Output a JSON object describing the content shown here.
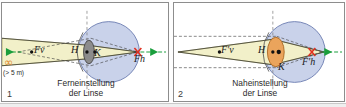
{
  "figure": {
    "title_semantic": "eye-accommodation-diagram",
    "panel_count": 2
  },
  "colors": {
    "sclera_fill": "#c9d2ea",
    "sclera_stroke": "#6b7bb0",
    "ray_cone_fill": "#f2f0c9",
    "ray_cone_stroke": "#8a8530",
    "lens_far_fill": "#8c8c8c",
    "lens_far_stroke": "#3a3a3a",
    "lens_near_fill": "#eaa45c",
    "lens_near_stroke": "#a8651f",
    "axis_green": "#1a9e3c",
    "focus_red": "#e03020",
    "infinity_orange": "#e08a2e",
    "dashed_gray": "#707070",
    "panel_border": "#8d8d8d",
    "label_black": "#1a1a1a"
  },
  "panels": [
    {
      "number": "1",
      "caption_line1": "Ferneinstellung",
      "caption_line2": "der Linse",
      "distance_note": "(> 5 m)",
      "infinity_symbol": "∞",
      "labels": [
        {
          "name": "front-focal-point",
          "text": "Fv"
        },
        {
          "name": "principal-plane",
          "text": "H"
        },
        {
          "name": "nodal-point",
          "text": "K"
        },
        {
          "name": "rear-focal-point",
          "text": "Fh"
        }
      ],
      "lens_state": "flattened",
      "object_distance": "infinity"
    },
    {
      "number": "2",
      "caption_line1": "Naheinstellung",
      "caption_line2": "der Linse",
      "distance_note": "",
      "infinity_symbol": "",
      "labels": [
        {
          "name": "front-focal-point",
          "text": "F'v"
        },
        {
          "name": "principal-plane",
          "text": "H"
        },
        {
          "name": "nodal-point",
          "text": "K"
        },
        {
          "name": "rear-focal-point",
          "text": "F'h"
        }
      ],
      "lens_state": "rounded-accommodated",
      "object_distance": "near"
    }
  ]
}
